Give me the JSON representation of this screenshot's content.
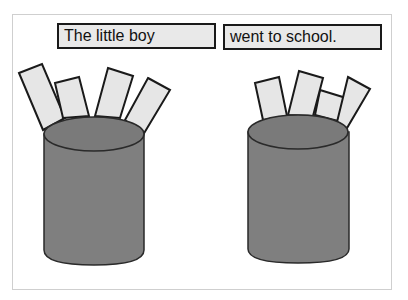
{
  "sentence": {
    "part1": "The little boy",
    "part2": "went to school."
  },
  "colors": {
    "card_fill": "#e6e6e6",
    "card_stroke": "#1a1a1a",
    "cup_fill": "#7f7f7f",
    "frame_border": "#cfcfcf"
  },
  "cups": [
    {
      "id": "left-cup",
      "card_count": 4
    },
    {
      "id": "right-cup",
      "card_count": 4
    }
  ]
}
